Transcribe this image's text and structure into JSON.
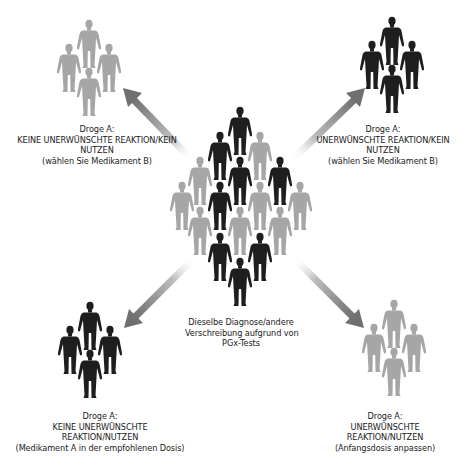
{
  "diagram": {
    "colors": {
      "dark_figure": "#1e1e1e",
      "light_figure": "#a6a6a6",
      "arrow": "#8a8a8a",
      "text": "#222222",
      "background": "#ffffff"
    },
    "center": {
      "caption_lines": [
        "Dieselbe Diagnose/andere",
        "Verschreibung aufgrund von",
        "PGx-Tests"
      ],
      "figures": [
        {
          "x": 240,
          "y": 107,
          "shade": "dark"
        },
        {
          "x": 220,
          "y": 132,
          "shade": "dark"
        },
        {
          "x": 260,
          "y": 132,
          "shade": "light"
        },
        {
          "x": 200,
          "y": 157,
          "shade": "light"
        },
        {
          "x": 240,
          "y": 157,
          "shade": "dark"
        },
        {
          "x": 280,
          "y": 157,
          "shade": "dark"
        },
        {
          "x": 182,
          "y": 182,
          "shade": "light"
        },
        {
          "x": 220,
          "y": 182,
          "shade": "dark"
        },
        {
          "x": 260,
          "y": 182,
          "shade": "light"
        },
        {
          "x": 300,
          "y": 182,
          "shade": "light"
        },
        {
          "x": 200,
          "y": 207,
          "shade": "light"
        },
        {
          "x": 240,
          "y": 207,
          "shade": "light"
        },
        {
          "x": 280,
          "y": 207,
          "shade": "light"
        },
        {
          "x": 220,
          "y": 233,
          "shade": "dark"
        },
        {
          "x": 260,
          "y": 233,
          "shade": "dark"
        },
        {
          "x": 240,
          "y": 258,
          "shade": "dark"
        }
      ]
    },
    "outcomes": {
      "top_left": {
        "shade": "light",
        "lines": [
          "Droge A:",
          "KEINE UNERWÜNSCHTE REAKTION/KEIN",
          "NUTZEN",
          "(wählen Sie Medikament B)"
        ]
      },
      "top_right": {
        "shade": "dark",
        "lines": [
          "Droge A:",
          "UNERWÜNSCHTE REAKTION/KEIN",
          "NUTZEN",
          "(wählen Sie Medikament B)"
        ]
      },
      "bottom_left": {
        "shade": "dark",
        "lines": [
          "Droge A:",
          "KEINE UNERWÜNSCHTE",
          "REAKTION/NUTZEN",
          "(Medikament A in der empfohlenen Dosis)"
        ]
      },
      "bottom_right": {
        "shade": "light",
        "lines": [
          "Droge A:",
          "UNERWÜNSCHTE",
          "REAKTION/NUTZEN",
          "(Anfangsdosis anpassen)"
        ]
      }
    }
  }
}
